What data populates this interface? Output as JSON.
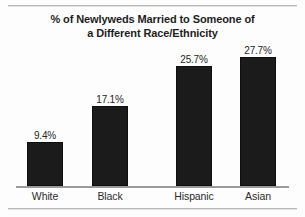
{
  "chart_data": {
    "type": "bar",
    "title": "% of Newlyweds Married to Someone of a Different Race/Ethnicity",
    "title_lines": [
      "% of Newlyweds Married to Someone of",
      "a Different Race/Ethnicity"
    ],
    "categories": [
      "White",
      "Black",
      "Hispanic",
      "Asian"
    ],
    "values": [
      9.4,
      17.1,
      25.7,
      27.7
    ],
    "value_labels": [
      "9.4%",
      "17.1%",
      "25.7%",
      "27.7%"
    ],
    "xlabel": "",
    "ylabel": "",
    "ylim": [
      0,
      31
    ],
    "grid": false,
    "legend": null,
    "bar_color": "#1b1b1b",
    "axis_color": "#9a9a9a",
    "background_color": "#fdfdfd"
  }
}
